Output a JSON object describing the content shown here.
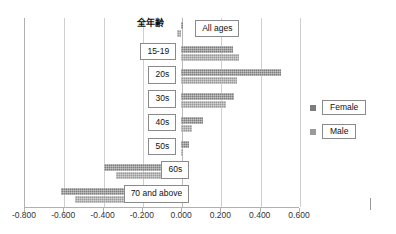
{
  "chart_data": {
    "type": "bar",
    "orientation": "horizontal",
    "title": "",
    "subtitle": "",
    "xlabel": "",
    "ylabel": "",
    "xlim": [
      -0.8,
      0.6
    ],
    "xticks": [
      "-0.800",
      "-0.600",
      "-0.400",
      "-0.200",
      "0.000",
      "0.200",
      "0.400",
      "0.600"
    ],
    "xtick_values": [
      -0.8,
      -0.6,
      -0.4,
      -0.2,
      0,
      0.2,
      0.4,
      0.6
    ],
    "grid": true,
    "grid_axis": "x",
    "legend_position": "right",
    "categories": [
      "全年齢",
      "15-19",
      "20s",
      "30s",
      "40s",
      "50s",
      "60s",
      "70 and above"
    ],
    "annotations": [
      {
        "text": "All ages",
        "target_category": "全年齢"
      }
    ],
    "series": [
      {
        "name": "Female",
        "color": "#7d7d7d",
        "values": [
          0.012,
          0.266,
          0.506,
          0.27,
          0.11,
          0.04,
          -0.395,
          -0.61
        ]
      },
      {
        "name": "Male",
        "color": "#9a9a9a",
        "values": [
          -0.02,
          0.293,
          0.284,
          0.226,
          0.057,
          0.005,
          -0.33,
          -0.54
        ]
      }
    ]
  },
  "legend": {
    "items": [
      {
        "label": "Female",
        "color": "#7d7d7d"
      },
      {
        "label": "Male",
        "color": "#9a9a9a"
      }
    ]
  },
  "labels": {
    "all_ages_jp": "全年齢",
    "all_ages_en": "All ages",
    "age_15_19": "15-19",
    "age_20s": "20s",
    "age_30s": "30s",
    "age_40s": "40s",
    "age_50s": "50s",
    "age_60s": "60s",
    "age_70_above": "70 and above"
  },
  "axis": {
    "tick_0": "-0.800",
    "tick_1": "-0.600",
    "tick_2": "-0.400",
    "tick_3": "-0.200",
    "tick_4": "0.000",
    "tick_5": "0.200",
    "tick_6": "0.400",
    "tick_7": "0.600"
  }
}
